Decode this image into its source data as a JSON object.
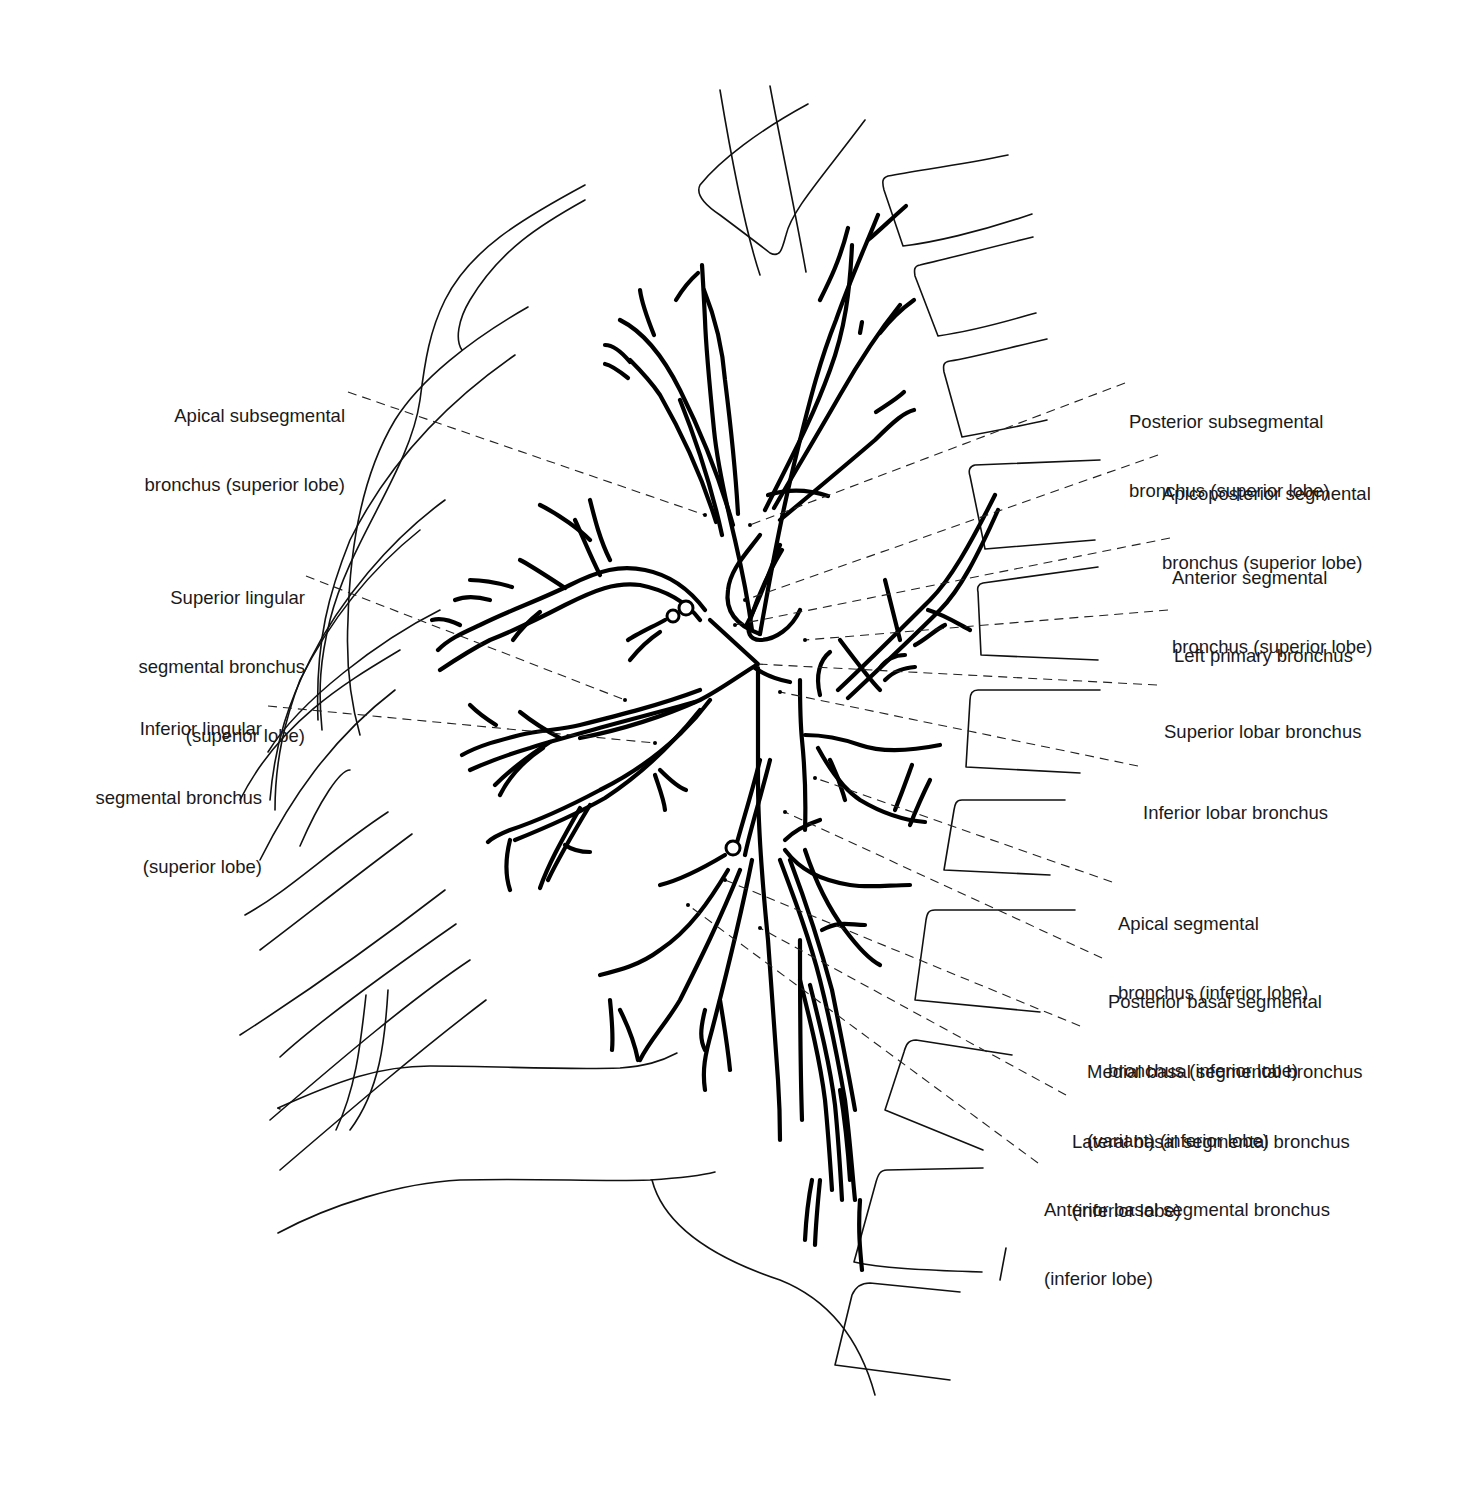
{
  "figure": {
    "colors": {
      "line": "#000000",
      "background": "#ffffff",
      "text": "#1a1a1a"
    }
  },
  "labels": {
    "left": [
      {
        "id": "apical-subsegmental",
        "lines": [
          "Apical subsegmental",
          "bronchus (superior lobe)"
        ]
      },
      {
        "id": "superior-lingular",
        "lines": [
          "Superior lingular",
          "segmental bronchus",
          "(superior lobe)"
        ]
      },
      {
        "id": "inferior-lingular",
        "lines": [
          "Inferior lingular",
          "segmental bronchus",
          "(superior lobe)"
        ]
      }
    ],
    "right": [
      {
        "id": "posterior-subsegmental",
        "lines": [
          "Posterior subsegmental",
          "bronchus (superior lobe)"
        ]
      },
      {
        "id": "apicoposterior-segmental",
        "lines": [
          "Apicoposterior segmental",
          "bronchus (superior lobe)"
        ]
      },
      {
        "id": "anterior-segmental",
        "lines": [
          "Anterior segmental",
          "bronchus (superior lobe)"
        ]
      },
      {
        "id": "left-primary",
        "lines": [
          "Left primary bronchus"
        ]
      },
      {
        "id": "superior-lobar",
        "lines": [
          "Superior lobar bronchus"
        ]
      },
      {
        "id": "inferior-lobar",
        "lines": [
          "Inferior lobar bronchus"
        ]
      },
      {
        "id": "apical-segmental-inferior",
        "lines": [
          "Apical segmental",
          "bronchus (inferior lobe)"
        ]
      },
      {
        "id": "posterior-basal",
        "lines": [
          "Posterior basal segmental",
          "bronchus (inferior lobe)"
        ]
      },
      {
        "id": "medial-basal",
        "lines": [
          "Medial basal segmental bronchus",
          "(variant) (inferior lobe)"
        ]
      },
      {
        "id": "lateral-basal",
        "lines": [
          "Lateral basal segmental bronchus",
          "(inferior lobe)"
        ]
      },
      {
        "id": "anterior-basal",
        "lines": [
          "Anterior basal segmental bronchus",
          "(inferior lobe)"
        ]
      }
    ]
  }
}
